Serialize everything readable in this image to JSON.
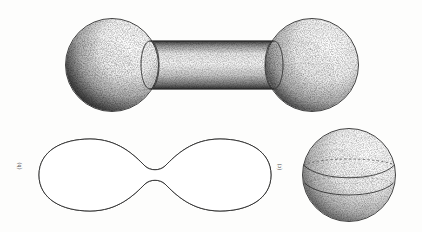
{
  "figure": {
    "background_color": "#fdfdfc",
    "ink_color": "#2b2b2b",
    "stipple_color": "#3a3a3a",
    "light_direction": "upper-right",
    "panels": [
      {
        "id": "panel-top",
        "name": "dumbbell-cylinder-surface",
        "description": "Two spheres connected by a straight circular cylinder; the cylinder end circles are drawn as dashed ellipses where they meet the spheres.",
        "center": [
          212,
          65
        ],
        "left_sphere": {
          "cx": 112,
          "cy": 65,
          "r": 47
        },
        "right_sphere": {
          "cx": 312,
          "cy": 65,
          "r": 47
        },
        "cylinder": {
          "x1": 150,
          "x2": 274,
          "half_height": 24
        },
        "hidden_line_style": "dashed"
      },
      {
        "id": "panel-bottom-left",
        "name": "smooth-peanut-surface",
        "description": "A smooth peanut / hourglass surface of revolution with a pinched neck at the centre.",
        "center": [
          155,
          175
        ],
        "lobe_left": {
          "cx": 95,
          "cy": 175,
          "rx": 56,
          "ry": 35
        },
        "lobe_right": {
          "cx": 215,
          "cy": 175,
          "rx": 56,
          "ry": 35
        },
        "neck": {
          "x": 155,
          "half_height": 9
        }
      },
      {
        "id": "panel-bottom-right",
        "name": "banded-sphere",
        "description": "A sphere marked with an equatorial band: the rear arc of the band is dashed and the front arc is solid.",
        "center": [
          349,
          175
        ],
        "sphere": {
          "cx": 349,
          "cy": 175,
          "r": 47
        },
        "band": {
          "upper_arc": "dashed",
          "lower_arc": "solid",
          "upper_y": 164,
          "lower_y": 186
        }
      }
    ],
    "labels": {
      "left": "(b)",
      "right": "(c)",
      "orientation": "rotated-90-ccw"
    }
  }
}
